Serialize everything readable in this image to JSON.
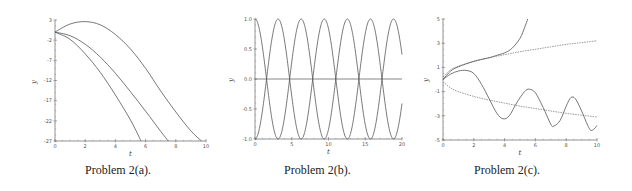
{
  "chart_data": [
    {
      "type": "line",
      "title": "",
      "caption": "Problem 2(a).",
      "xlabel": "t",
      "ylabel": "y",
      "xlim": [
        0,
        10
      ],
      "ylim": [
        -27,
        3
      ],
      "xticks": [
        0,
        2,
        4,
        6,
        8,
        10
      ],
      "yticks": [
        3,
        -2,
        -7,
        -12,
        -17,
        -22,
        -27
      ],
      "grid": false,
      "series": [
        {
          "name": "upper parabola",
          "style": "solid",
          "points": [
            [
              0,
              0
            ],
            [
              1,
              2
            ],
            [
              2,
              2.6
            ],
            [
              3,
              1.8
            ],
            [
              4,
              -0.6
            ],
            [
              5,
              -4.2
            ],
            [
              6,
              -9
            ],
            [
              7,
              -14.6
            ],
            [
              8,
              -19.8
            ],
            [
              9,
              -24.5
            ],
            [
              9.7,
              -27
            ]
          ]
        },
        {
          "name": "middle parabola",
          "style": "solid",
          "points": [
            [
              0,
              0
            ],
            [
              1,
              -0.9
            ],
            [
              2,
              -3
            ],
            [
              3,
              -6.2
            ],
            [
              4,
              -10.2
            ],
            [
              5,
              -14.8
            ],
            [
              6,
              -19.6
            ],
            [
              7,
              -24.6
            ],
            [
              7.5,
              -27
            ]
          ]
        },
        {
          "name": "lower parabola",
          "style": "solid",
          "points": [
            [
              0,
              0
            ],
            [
              1,
              -1.8
            ],
            [
              2,
              -5.4
            ],
            [
              3,
              -10
            ],
            [
              4,
              -15.6
            ],
            [
              5,
              -21.8
            ],
            [
              5.7,
              -27
            ]
          ]
        }
      ]
    },
    {
      "type": "line",
      "title": "",
      "caption": "Problem 2(b).",
      "xlabel": "t",
      "ylabel": "y",
      "xlim": [
        0,
        20
      ],
      "ylim": [
        -1.0,
        1.0
      ],
      "xticks": [
        0,
        5,
        10,
        15,
        20
      ],
      "yticks": [
        "1.0",
        "0.5",
        "0.0",
        "-0.5",
        "-1.0"
      ],
      "grid": false,
      "series": [
        {
          "name": "cos(t)",
          "style": "solid",
          "function": "cos",
          "amplitude": 1,
          "period": 6.2832
        },
        {
          "name": "-cos(t)",
          "style": "solid",
          "function": "-cos",
          "amplitude": 1,
          "period": 6.2832
        },
        {
          "name": "y = 0",
          "style": "solid",
          "function": "zero"
        }
      ]
    },
    {
      "type": "line",
      "title": "",
      "caption": "Problem 2(c).",
      "xlabel": "t",
      "ylabel": "y",
      "xlim": [
        0,
        10
      ],
      "ylim": [
        -5,
        5
      ],
      "xticks": [
        0,
        2,
        4,
        6,
        8,
        10
      ],
      "yticks": [
        5,
        3,
        1,
        -1,
        -3,
        -5
      ],
      "grid": false,
      "series": [
        {
          "name": "blow-up solution",
          "style": "solid",
          "points": [
            [
              0,
              0
            ],
            [
              0.5,
              0.7
            ],
            [
              1,
              1.05
            ],
            [
              2,
              1.5
            ],
            [
              3,
              1.8
            ],
            [
              3.5,
              2
            ],
            [
              4,
              2.2
            ],
            [
              4.5,
              2.6
            ],
            [
              5,
              3.4
            ],
            [
              5.3,
              4.3
            ],
            [
              5.5,
              5
            ]
          ]
        },
        {
          "name": "upper sqrt bound",
          "style": "dashed",
          "points": [
            [
              0,
              0.2
            ],
            [
              0.5,
              0.8
            ],
            [
              1,
              1.1
            ],
            [
              2,
              1.5
            ],
            [
              3,
              1.8
            ],
            [
              4,
              2.05
            ],
            [
              5,
              2.3
            ],
            [
              6,
              2.5
            ],
            [
              7,
              2.7
            ],
            [
              8,
              2.9
            ],
            [
              9,
              3.05
            ],
            [
              10,
              3.2
            ]
          ]
        },
        {
          "name": "oscillating solution",
          "style": "solid",
          "points": [
            [
              0,
              0
            ],
            [
              0.5,
              0.45
            ],
            [
              1,
              0.7
            ],
            [
              1.5,
              0.75
            ],
            [
              2,
              0.5
            ],
            [
              2.5,
              -0.4
            ],
            [
              3,
              -1.6
            ],
            [
              3.5,
              -2.8
            ],
            [
              3.9,
              -3.25
            ],
            [
              4.3,
              -3.0
            ],
            [
              4.8,
              -1.9
            ],
            [
              5.3,
              -1.0
            ],
            [
              5.6,
              -0.8
            ],
            [
              6,
              -1.1
            ],
            [
              6.5,
              -2.3
            ],
            [
              7,
              -3.7
            ],
            [
              7.2,
              -3.85
            ],
            [
              7.6,
              -3.4
            ],
            [
              8,
              -2.2
            ],
            [
              8.3,
              -1.5
            ],
            [
              8.6,
              -1.6
            ],
            [
              9,
              -2.6
            ],
            [
              9.4,
              -3.8
            ],
            [
              9.6,
              -4.2
            ],
            [
              9.8,
              -4.1
            ],
            [
              10,
              -3.8
            ]
          ]
        },
        {
          "name": "lower sqrt bound",
          "style": "dashed",
          "points": [
            [
              0,
              -0.2
            ],
            [
              0.5,
              -0.7
            ],
            [
              1,
              -1.0
            ],
            [
              2,
              -1.4
            ],
            [
              3,
              -1.7
            ],
            [
              4,
              -1.95
            ],
            [
              5,
              -2.2
            ],
            [
              6,
              -2.4
            ],
            [
              7,
              -2.6
            ],
            [
              8,
              -2.8
            ],
            [
              9,
              -2.95
            ],
            [
              10,
              -3.1
            ]
          ]
        }
      ]
    }
  ],
  "captions": {
    "a": "Problem 2(a).",
    "b": "Problem 2(b).",
    "c": "Problem 2(c)."
  },
  "colors": {
    "curve": "#555555",
    "axis": "#777777",
    "text": "#222222"
  }
}
